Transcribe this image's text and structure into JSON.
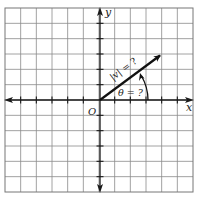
{
  "diagram": {
    "type": "coordinate-plane-vector",
    "grid": {
      "cells_x": 12,
      "cells_y": 12,
      "line_color": "#8a8a8a",
      "border_color": "#777777"
    },
    "axes": {
      "x_label": "x",
      "y_label": "y",
      "origin_label": "O",
      "axis_color": "#1a1a1a"
    },
    "vector": {
      "from": [
        0,
        0
      ],
      "to": [
        4,
        3
      ],
      "magnitude_label": "|v| = ?",
      "angle_label": "θ = ?",
      "color": "#111111"
    }
  }
}
